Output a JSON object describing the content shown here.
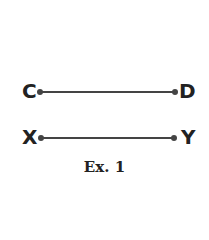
{
  "figure": {
    "segments": [
      {
        "start_label": "C",
        "end_label": "D"
      },
      {
        "start_label": "X",
        "end_label": "Y"
      }
    ],
    "caption": "Ex. 1",
    "stroke_color": "#444444"
  }
}
